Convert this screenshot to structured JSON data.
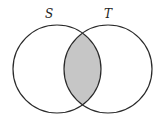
{
  "diagram": {
    "type": "venn",
    "sets": [
      {
        "label": "S",
        "cx": 57,
        "cy": 69,
        "r": 44
      },
      {
        "label": "T",
        "cx": 108,
        "cy": 69,
        "r": 44
      }
    ],
    "shaded_region": "S ∩ T",
    "colors": {
      "stroke": "#2a2a2a",
      "shade": "#c6c6c6",
      "background": "#ffffff"
    }
  }
}
